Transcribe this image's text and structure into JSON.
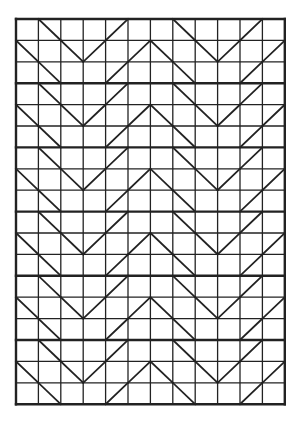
{
  "diagram": {
    "type": "chevron-grid-pattern",
    "columns": 12,
    "rows": 18,
    "origin": [
      16,
      19
    ],
    "cell_width": 22.4,
    "cell_height": 21.4,
    "line_color": "#222222",
    "background": "#ffffff",
    "thin_line_width": 1.3,
    "thick_line_width": 2.4,
    "thick_row_lines_every": 3,
    "row_patterns": {
      "A": [
        {
          "col": 1,
          "dir": "\\"
        },
        {
          "col": 4,
          "dir": "/"
        },
        {
          "col": 7,
          "dir": "\\"
        },
        {
          "col": 10,
          "dir": "/"
        }
      ],
      "B": [
        {
          "col": 0,
          "dir": "\\"
        },
        {
          "col": 2,
          "dir": "\\"
        },
        {
          "col": 3,
          "dir": "/"
        },
        {
          "col": 5,
          "dir": "/"
        },
        {
          "col": 6,
          "dir": "\\"
        },
        {
          "col": 8,
          "dir": "\\"
        },
        {
          "col": 9,
          "dir": "/"
        },
        {
          "col": 11,
          "dir": "/"
        }
      ]
    },
    "row_sequence": [
      "A",
      "B",
      "A",
      "A",
      "B",
      "A",
      "A",
      "B",
      "A",
      "A",
      "B",
      "A",
      "A",
      "B",
      "A",
      "A",
      "B",
      "A"
    ]
  }
}
